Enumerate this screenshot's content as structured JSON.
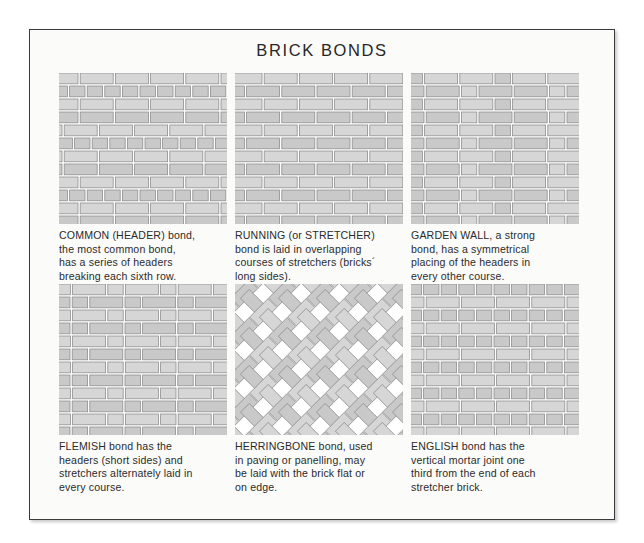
{
  "title": "BRICK BONDS",
  "colors": {
    "page_background": "#ffffff",
    "card_background": "#fbfbfa",
    "card_border": "#3a3a3a",
    "brick_fill": "#c9c9c9",
    "brick_fill_light": "#d6d6d6",
    "brick_stroke": "#8e8e8e",
    "mortar": "#ffffff",
    "text": "#2b2b2b"
  },
  "panels": [
    {
      "id": "common-header-bond",
      "name": "COMMON (HEADER)",
      "pattern": "common",
      "caption": "COMMON (HEADER) bond,\nthe most common bond,\nhas a series of headers\nbreaking each sixth row."
    },
    {
      "id": "running-stretcher-bond",
      "name": "RUNNING (or STRETCHER)",
      "pattern": "running",
      "caption": "RUNNING (or STRETCHER)\nbond is laid in overlapping\ncourses of stretchers (bricks´\nlong sides)."
    },
    {
      "id": "garden-wall-bond",
      "name": "GARDEN WALL",
      "pattern": "garden",
      "caption": "GARDEN WALL, a strong\nbond, has a symmetrical\nplacing of the headers in\nevery other course."
    },
    {
      "id": "flemish-bond",
      "name": "FLEMISH",
      "pattern": "flemish",
      "caption": "FLEMISH bond has the\nheaders (short sides) and\nstretchers alternately laid in\nevery course."
    },
    {
      "id": "herringbone-bond",
      "name": "HERRINGBONE",
      "pattern": "herringbone",
      "caption": "HERRINGBONE bond, used\nin paving or panelling, may\nbe laid with the brick flat or\non edge."
    },
    {
      "id": "english-bond",
      "name": "ENGLISH",
      "pattern": "english",
      "caption": "ENGLISH bond has the\nvertical mortar joint one\nthird from the end of each\nstretcher brick."
    }
  ]
}
